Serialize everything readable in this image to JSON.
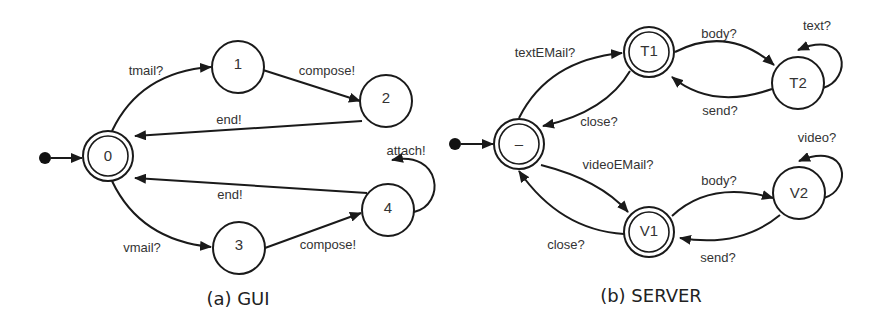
{
  "diagrams": {
    "gui": {
      "caption": "(a) GUI",
      "states": {
        "s0": "0",
        "s1": "1",
        "s2": "2",
        "s3": "3",
        "s4": "4"
      },
      "initial_state": "0",
      "accepting_states": [
        "0"
      ],
      "transitions": [
        {
          "from": "0",
          "to": "1",
          "label": "tmail?"
        },
        {
          "from": "1",
          "to": "2",
          "label": "compose!"
        },
        {
          "from": "2",
          "to": "0",
          "label": "end!"
        },
        {
          "from": "0",
          "to": "3",
          "label": "vmail?"
        },
        {
          "from": "3",
          "to": "4",
          "label": "compose!"
        },
        {
          "from": "4",
          "to": "0",
          "label": "end!"
        },
        {
          "from": "4",
          "to": "4",
          "label": "attach!"
        }
      ]
    },
    "server": {
      "caption": "(b) SERVER",
      "states": {
        "init": "–",
        "t1": "T1",
        "t2": "T2",
        "v1": "V1",
        "v2": "V2"
      },
      "initial_state": "–",
      "accepting_states": [
        "–",
        "T1",
        "V1"
      ],
      "transitions": [
        {
          "from": "–",
          "to": "T1",
          "label": "textEMail?"
        },
        {
          "from": "T1",
          "to": "–",
          "label": "close?"
        },
        {
          "from": "T1",
          "to": "T2",
          "label": "body?"
        },
        {
          "from": "T2",
          "to": "T1",
          "label": "send?"
        },
        {
          "from": "T2",
          "to": "T2",
          "label": "text?"
        },
        {
          "from": "–",
          "to": "V1",
          "label": "videoEMail?"
        },
        {
          "from": "V1",
          "to": "–",
          "label": "close?"
        },
        {
          "from": "V1",
          "to": "V2",
          "label": "body?"
        },
        {
          "from": "V2",
          "to": "V1",
          "label": "send?"
        },
        {
          "from": "V2",
          "to": "V2",
          "label": "video?"
        }
      ]
    }
  }
}
